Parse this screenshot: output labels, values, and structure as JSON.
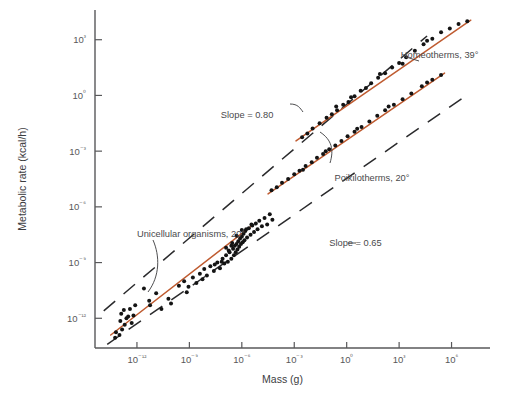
{
  "chart_data": {
    "type": "scatter",
    "title": "",
    "xlabel": "Mass (g)",
    "ylabel": "Metabolic rate (kcal/h)",
    "x_scale": "log10",
    "y_scale": "log10",
    "xlim": [
      -14.4,
      8.2
    ],
    "ylim": [
      -13.6,
      4.6
    ],
    "xticks": [
      -12,
      -9,
      -6,
      -3,
      0,
      3,
      6
    ],
    "xticklabels": [
      "10⁻¹²",
      "10⁻⁹",
      "10⁻⁶",
      "10⁻³",
      "10⁰",
      "10³",
      "10⁶"
    ],
    "yticks": [
      3,
      0,
      -3,
      -6,
      -9,
      -12
    ],
    "yticklabels": [
      "10³",
      "10⁰",
      "10⁻³",
      "10⁻⁶",
      "10⁻⁹",
      "10⁻¹²"
    ],
    "grid": false,
    "legend": "inline-annotations",
    "annotations": [
      {
        "name": "slope-080-label",
        "text": "Slope  =  0.80",
        "x": -7.2,
        "y": -1.2
      },
      {
        "name": "slope-065-label",
        "text": "Slope  =  0.65",
        "x": -1.0,
        "y": -8.1
      },
      {
        "name": "homeotherms-label",
        "text": "Homeotherms, 39°",
        "x": 3.1,
        "y": 2.0
      },
      {
        "name": "poikilotherms-label",
        "text": "Poikilotherms, 20°",
        "x": -0.7,
        "y": -4.6
      },
      {
        "name": "unicellular-label",
        "text": "Unicellular organisms, 20°",
        "x": -12.0,
        "y": -7.6
      }
    ],
    "series": [
      {
        "name": "Homeotherms, 39°",
        "color": "#bf5b30",
        "fit_line": {
          "slope": 0.75,
          "x_start": -2.9,
          "x_end": 7.1,
          "y_start": -2.45,
          "y_end": 4.05
        },
        "points": [
          [
            -2.55,
            -2.25
          ],
          [
            -2.25,
            -2.05
          ],
          [
            -1.95,
            -1.78
          ],
          [
            -1.55,
            -1.5
          ],
          [
            -1.15,
            -1.2
          ],
          [
            -0.85,
            -1.02
          ],
          [
            -0.55,
            -0.8
          ],
          [
            -0.2,
            -0.5
          ],
          [
            0.1,
            -0.35
          ],
          [
            0.45,
            -0.05
          ],
          [
            0.8,
            0.25
          ],
          [
            1.1,
            0.4
          ],
          [
            1.4,
            0.65
          ],
          [
            1.8,
            0.95
          ],
          [
            2.2,
            1.2
          ],
          [
            2.6,
            1.5
          ],
          [
            3.0,
            1.75
          ],
          [
            3.4,
            2.05
          ],
          [
            3.9,
            2.4
          ],
          [
            4.4,
            2.75
          ],
          [
            4.9,
            3.05
          ],
          [
            5.4,
            3.4
          ],
          [
            5.9,
            3.6
          ],
          [
            6.4,
            3.85
          ],
          [
            6.9,
            4.0
          ],
          [
            -0.6,
            -0.6
          ],
          [
            0.25,
            -0.1
          ],
          [
            1.9,
            1.15
          ],
          [
            3.2,
            1.7
          ],
          [
            4.6,
            2.95
          ]
        ]
      },
      {
        "name": "Poikilotherms, 20°",
        "color": "#bf5b30",
        "fit_line": {
          "slope": 0.75,
          "x_start": -4.5,
          "x_end": 5.6,
          "y_start": -5.3,
          "y_end": 1.2
        },
        "points": [
          [
            -4.3,
            -5.1
          ],
          [
            -4.0,
            -4.95
          ],
          [
            -3.7,
            -4.7
          ],
          [
            -3.35,
            -4.5
          ],
          [
            -3.0,
            -4.25
          ],
          [
            -2.7,
            -4.05
          ],
          [
            -2.35,
            -3.8
          ],
          [
            -2.0,
            -3.6
          ],
          [
            -1.7,
            -3.35
          ],
          [
            -1.35,
            -3.15
          ],
          [
            -1.0,
            -2.9
          ],
          [
            -0.65,
            -2.7
          ],
          [
            -0.3,
            -2.45
          ],
          [
            0.05,
            -2.2
          ],
          [
            0.45,
            -1.95
          ],
          [
            0.85,
            -1.7
          ],
          [
            1.3,
            -1.4
          ],
          [
            1.75,
            -1.1
          ],
          [
            2.2,
            -0.8
          ],
          [
            2.7,
            -0.5
          ],
          [
            3.2,
            -0.2
          ],
          [
            3.7,
            0.1
          ],
          [
            4.3,
            0.5
          ],
          [
            4.9,
            0.85
          ],
          [
            5.4,
            1.1
          ],
          [
            -2.5,
            -4.0
          ],
          [
            -1.2,
            -3.0
          ],
          [
            0.6,
            -1.8
          ],
          [
            2.4,
            -0.6
          ],
          [
            4.6,
            0.7
          ]
        ]
      },
      {
        "name": "Unicellular organisms, 20°",
        "color": "#bf5b30",
        "fit_line": {
          "slope": 0.75,
          "x_start": -13.5,
          "x_end": -5.4,
          "y_start": -12.9,
          "y_end": -7.0
        },
        "points": [
          [
            -13.2,
            -12.75
          ],
          [
            -13.0,
            -12.9
          ],
          [
            -12.85,
            -12.6
          ],
          [
            -13.25,
            -13.05
          ],
          [
            -12.7,
            -12.35
          ],
          [
            -12.95,
            -12.15
          ],
          [
            -12.6,
            -12.0
          ],
          [
            -12.9,
            -11.75
          ],
          [
            -12.5,
            -11.9
          ],
          [
            -12.75,
            -11.55
          ],
          [
            -12.4,
            -11.5
          ],
          [
            -12.2,
            -11.85
          ],
          [
            -11.3,
            -11.05
          ],
          [
            -11.25,
            -11.3
          ],
          [
            -10.9,
            -10.65
          ],
          [
            -11.6,
            -10.4
          ],
          [
            -10.6,
            -11.5
          ],
          [
            -10.2,
            -10.95
          ],
          [
            -10.05,
            -11.2
          ],
          [
            -9.6,
            -10.25
          ],
          [
            -9.3,
            -10.0
          ],
          [
            -9.05,
            -10.3
          ],
          [
            -8.8,
            -9.8
          ],
          [
            -8.6,
            -10.1
          ],
          [
            -8.4,
            -9.6
          ],
          [
            -8.15,
            -9.35
          ],
          [
            -8.0,
            -9.7
          ],
          [
            -7.8,
            -9.2
          ],
          [
            -7.6,
            -9.45
          ],
          [
            -7.4,
            -9.0
          ],
          [
            -7.25,
            -9.3
          ],
          [
            -7.1,
            -8.8
          ],
          [
            -7.0,
            -9.05
          ],
          [
            -6.9,
            -8.6
          ],
          [
            -6.8,
            -8.95
          ],
          [
            -6.7,
            -8.45
          ],
          [
            -6.6,
            -8.8
          ],
          [
            -6.5,
            -8.25
          ],
          [
            -6.45,
            -8.6
          ],
          [
            -6.4,
            -8.1
          ],
          [
            -6.35,
            -8.45
          ],
          [
            -6.3,
            -8.0
          ],
          [
            -6.25,
            -8.3
          ],
          [
            -6.2,
            -7.85
          ],
          [
            -6.15,
            -8.15
          ],
          [
            -6.1,
            -7.7
          ],
          [
            -6.05,
            -8.0
          ],
          [
            -6.0,
            -7.6
          ],
          [
            -5.95,
            -7.9
          ],
          [
            -5.9,
            -7.45
          ],
          [
            -5.85,
            -7.8
          ],
          [
            -5.8,
            -7.3
          ],
          [
            -5.7,
            -7.65
          ],
          [
            -5.6,
            -7.15
          ],
          [
            -5.5,
            -7.5
          ],
          [
            -5.4,
            -7.0
          ],
          [
            -5.3,
            -7.35
          ],
          [
            -5.2,
            -6.9
          ],
          [
            -5.1,
            -7.2
          ],
          [
            -5.0,
            -6.75
          ],
          [
            -4.85,
            -7.05
          ],
          [
            -4.7,
            -6.6
          ],
          [
            -4.55,
            -6.95
          ],
          [
            -6.55,
            -7.95
          ],
          [
            -6.75,
            -8.35
          ],
          [
            -7.15,
            -8.95
          ],
          [
            -7.55,
            -9.1
          ],
          [
            -8.25,
            -9.9
          ],
          [
            -9.15,
            -10.6
          ],
          [
            -5.75,
            -7.2
          ],
          [
            -5.45,
            -6.95
          ],
          [
            -6.9,
            -8.2
          ],
          [
            -6.6,
            -8.1
          ],
          [
            -6.3,
            -7.55
          ],
          [
            -6.0,
            -7.25
          ],
          [
            -4.4,
            -6.4
          ],
          [
            -4.25,
            -6.7
          ],
          [
            -12.3,
            -12.25
          ],
          [
            -12.1,
            -11.3
          ]
        ]
      }
    ],
    "envelope_lines": [
      {
        "name": "upper-envelope-slope-080",
        "slope": 0.8,
        "label": "Slope  =  0.80",
        "x_start": -13.9,
        "y_start": -11.6,
        "x_end": 4.6,
        "y_end": 3.2
      },
      {
        "name": "lower-envelope-slope-065",
        "slope": 0.65,
        "label": "Slope  =  0.65",
        "x_start": -13.7,
        "y_start": -13.4,
        "x_end": 7.0,
        "y_end": 0.1
      }
    ]
  },
  "axes": {
    "y_title": "Metabolic rate (kcal/h)",
    "x_title": "Mass (g)"
  }
}
